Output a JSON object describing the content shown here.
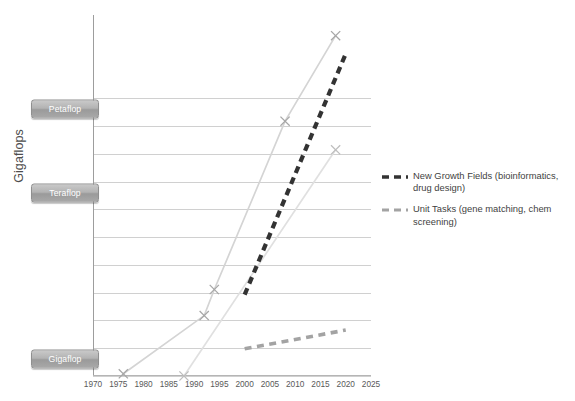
{
  "chart_data": {
    "type": "line",
    "title": "",
    "xlabel": "",
    "ylabel": "Gigaflops",
    "xlim": [
      1970,
      2025
    ],
    "ylim": [
      0.1,
      1000000000000
    ],
    "yscale": "log",
    "grid": true,
    "legend_position": "right",
    "xticks": [
      "1970",
      "1975",
      "1980",
      "1985",
      "1990",
      "1995",
      "2000",
      "2005",
      "2010",
      "2015",
      "2020",
      "2025"
    ],
    "xtick_values": [
      1970,
      1975,
      1980,
      1985,
      1990,
      1995,
      2000,
      2005,
      2010,
      2015,
      2020,
      2025
    ],
    "yticks": [
      "1,000,000,000.000",
      "100,000,000.000",
      "10,000,000.000",
      "1,000,000.000",
      "100,000.000",
      "10,000.000",
      "1,000.000",
      "100.000",
      "10.000",
      "1.000",
      "0.100"
    ],
    "ytick_values": [
      1000000000,
      100000000,
      10000000,
      1000000,
      100000,
      10000,
      1000,
      100,
      10,
      1,
      0.1
    ],
    "scale_markers": [
      {
        "label": "Petaflop",
        "value": 400000000
      },
      {
        "label": "Teraflop",
        "value": 400000
      },
      {
        "label": "Gigaflop",
        "value": 0.4
      }
    ],
    "series": [
      {
        "name": "Top Supercomputer Performance",
        "style": "solid",
        "color": "#d4d4d4",
        "marker": "x",
        "marker_color": "#a6a6a6",
        "x": [
          1976,
          1992,
          1994,
          2008,
          2018
        ],
        "y": [
          0.12,
          15,
          130,
          150000000,
          180000000000
        ]
      },
      {
        "name": "Desktop / Single Node Performance",
        "style": "solid",
        "color": "#e0e0e0",
        "marker": "x",
        "marker_color": "#bdbdbd",
        "x": [
          1988,
          2018
        ],
        "y": [
          0.1,
          14000000
        ]
      },
      {
        "name": "New Growth Fields (bioinformatics, drug design)",
        "style": "dashed",
        "color": "#333333",
        "marker": "none",
        "x": [
          2000,
          2020
        ],
        "y": [
          85,
          40000000000
        ]
      },
      {
        "name": "Unit Tasks (gene matching, chem screening)",
        "style": "dashed",
        "color": "#a3a3a3",
        "marker": "none",
        "x": [
          2000,
          2020
        ],
        "y": [
          0.95,
          4.5
        ]
      }
    ],
    "legend": [
      {
        "label": "New Growth Fields (bioinformatics, drug design)",
        "color": "#333333",
        "style": "dashed"
      },
      {
        "label": "Unit Tasks (gene matching, chem screening)",
        "color": "#a3a3a3",
        "style": "dashed"
      }
    ]
  }
}
